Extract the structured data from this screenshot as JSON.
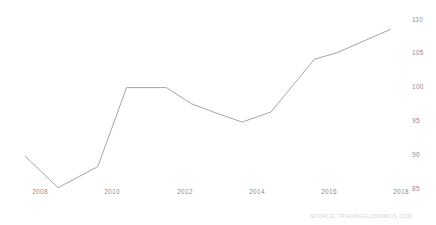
{
  "chart_data": {
    "type": "line",
    "title": "",
    "subtitle": "",
    "xlabel": "",
    "ylabel": "",
    "grid": false,
    "legend": false,
    "legend_position": "none",
    "xlim": [
      2007.4,
      2018.4
    ],
    "ylim": [
      84.0,
      110.8
    ],
    "x_ticks": [
      "2008",
      "2010",
      "2012",
      "2014",
      "2016",
      "2018"
    ],
    "x_tick_values": [
      2008,
      2010,
      2012,
      2014,
      2016,
      2018
    ],
    "y_ticks": [
      "85",
      "90",
      "95",
      "100",
      "105",
      "110"
    ],
    "y_tick_values": [
      85,
      90,
      95,
      100,
      105,
      110
    ],
    "y_axis_side": "right",
    "series": [
      {
        "name": "Index",
        "color": "#9a9aa2",
        "x": [
          2007.6,
          2008.5,
          2009.6,
          2010.4,
          2011.5,
          2012.2,
          2012.8,
          2013.6,
          2014.4,
          2015.6,
          2016.2,
          2017.7
        ],
        "values": [
          89.8,
          85.2,
          88.3,
          100.0,
          100.0,
          97.6,
          96.4,
          94.9,
          96.4,
          104.2,
          105.1,
          108.6
        ]
      }
    ],
    "annotations": [
      {
        "name": "source-watermark",
        "text": "SOURCE: TRADINGECONOMICS.COM",
        "position": "bottom-right"
      }
    ]
  },
  "axis_color": "#8d8d93",
  "line_color": "#9a9aa2",
  "background_color": "#ffffff"
}
